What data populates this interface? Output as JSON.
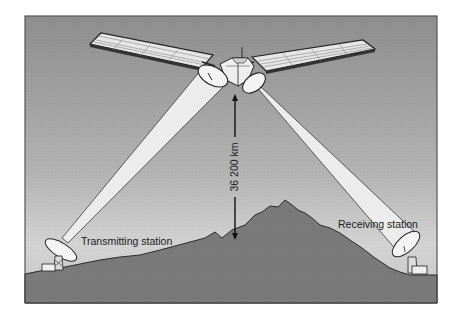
{
  "diagram": {
    "type": "satellite-communication-illustration",
    "labels": {
      "distance": "36 200 km",
      "transmitting": "Transmitting station",
      "receiving": "Receiving station"
    },
    "elements": [
      "geostationary-satellite",
      "left-solar-panel",
      "right-solar-panel",
      "transmit-beam",
      "receive-beam",
      "altitude-arrow",
      "mountain-terrain",
      "transmitting-dish",
      "receiving-dish"
    ],
    "colors": {
      "sky_top": "#8f8f8f",
      "sky_bottom": "#d2d2d2",
      "ground": "#7a7a7a",
      "beam": "#ececec",
      "outline": "#2a2a2a",
      "panel": "#e6e6e6"
    }
  }
}
